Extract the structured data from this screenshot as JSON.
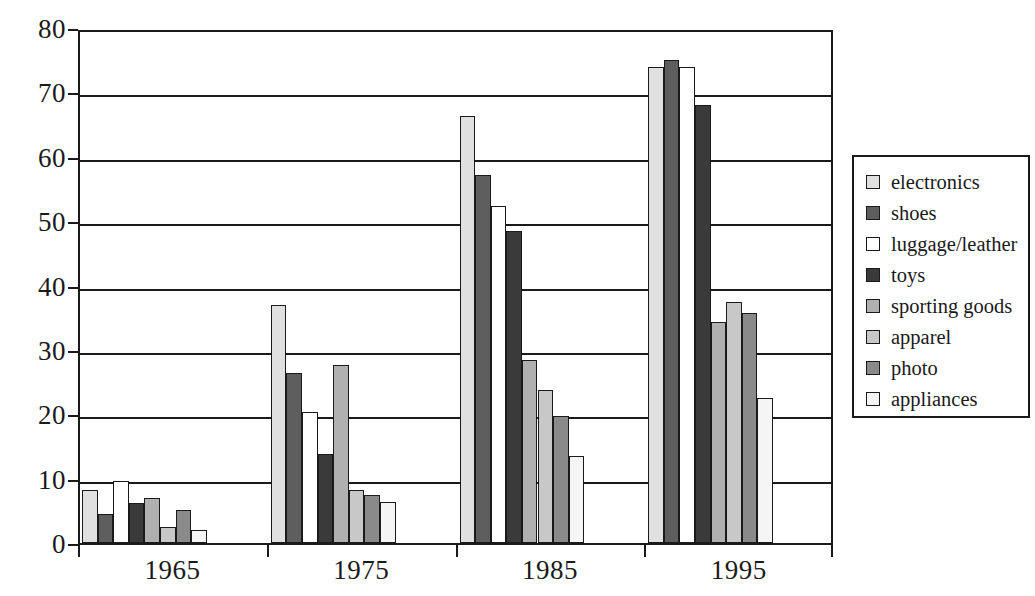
{
  "chart_data": {
    "type": "bar",
    "title": "",
    "xlabel": "",
    "ylabel": "",
    "categories": [
      "1965",
      "1975",
      "1985",
      "1995"
    ],
    "ylim": [
      0,
      80
    ],
    "yticks": [
      0,
      10,
      20,
      30,
      40,
      50,
      60,
      70,
      80
    ],
    "ytick_labels": [
      "0",
      "10",
      "20",
      "30",
      "40",
      "50",
      "60",
      "70",
      "80"
    ],
    "grid": true,
    "legend_position": "right",
    "series": [
      {
        "name": "electronics",
        "color": "#e0e0e0",
        "values": [
          8.3,
          37.0,
          66.3,
          74.0
        ]
      },
      {
        "name": "shoes",
        "color": "#5e5e5e",
        "values": [
          4.5,
          26.4,
          57.2,
          75.0
        ]
      },
      {
        "name": "luggage/leather",
        "color": "#ffffff",
        "values": [
          9.7,
          20.4,
          52.3,
          74.0
        ]
      },
      {
        "name": "toys",
        "color": "#3a3a3a",
        "values": [
          6.2,
          13.8,
          48.5,
          68.0
        ]
      },
      {
        "name": "sporting goods",
        "color": "#b0b0b0",
        "values": [
          7.0,
          27.7,
          28.5,
          34.4
        ]
      },
      {
        "name": "apparel",
        "color": "#c8c8c8",
        "values": [
          2.5,
          8.2,
          23.7,
          37.5
        ]
      },
      {
        "name": "photo",
        "color": "#8a8a8a",
        "values": [
          5.1,
          7.5,
          19.8,
          35.7
        ]
      },
      {
        "name": "appliances",
        "color": "#f5f5f5",
        "values": [
          2.0,
          6.4,
          13.5,
          22.6
        ]
      }
    ]
  },
  "legend": {
    "items": [
      {
        "label": "electronics"
      },
      {
        "label": "shoes"
      },
      {
        "label": "luggage/leather"
      },
      {
        "label": "toys"
      },
      {
        "label": "sporting goods"
      },
      {
        "label": "apparel"
      },
      {
        "label": "photo"
      },
      {
        "label": "appliances"
      }
    ]
  },
  "axis": {
    "y_labels": [
      "80",
      "70",
      "60",
      "50",
      "40",
      "30",
      "20",
      "10",
      "0"
    ],
    "x_labels": [
      "1965",
      "1975",
      "1985",
      "1995"
    ]
  }
}
